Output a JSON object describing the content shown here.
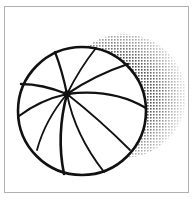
{
  "illustration": {
    "subject": "beach-ball",
    "colors": {
      "line": "#111111",
      "fill": "#ffffff",
      "shadow_dot": "#555555",
      "frame_border": "#b0b0b0"
    },
    "ball": {
      "cx": 82,
      "cy": 111,
      "r": 64
    },
    "hub": {
      "x": 67,
      "y": 94
    },
    "shadow": {
      "cx": 124,
      "cy": 96,
      "r": 62
    }
  }
}
